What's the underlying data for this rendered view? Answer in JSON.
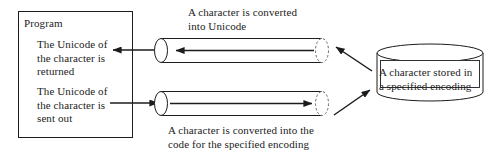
{
  "diagram": {
    "colors": {
      "stroke": "#1c1c1c",
      "text": "#1c1c1c",
      "background": "#ffffff"
    },
    "program_box": {
      "title": "Program",
      "line_1": "The Unicode of\nthe character is\nreturned",
      "line_2": "The Unicode of\nthe character is\nsent out"
    },
    "captions": {
      "top": "A character is converted\ninto Unicode",
      "bottom": "A character is converted into the\ncode for the specified encoding"
    },
    "storage": {
      "label": "A character stored in\na specified encoding",
      "shape": "cylinder-icon"
    },
    "pipes": [
      {
        "name": "decode-pipe",
        "direction": "left"
      },
      {
        "name": "encode-pipe",
        "direction": "right"
      }
    ]
  }
}
